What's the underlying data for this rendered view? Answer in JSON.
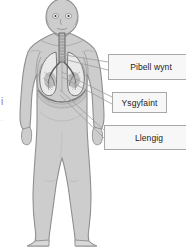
{
  "diagram": {
    "language": "Welsh",
    "background_color": "#ffffff"
  },
  "figure": {
    "name": "human-body-outline",
    "body_fill": "#cdcdcd",
    "body_outline": "#8f8f8f",
    "organ_fill": "#e8e8e8",
    "organ_outline": "#707070",
    "parts": [
      {
        "name": "head",
        "label_key": null
      },
      {
        "name": "neck",
        "label_key": null
      },
      {
        "name": "torso",
        "label_key": null
      },
      {
        "name": "trachea",
        "label_key": "trachea"
      },
      {
        "name": "bronchi",
        "label_key": "trachea"
      },
      {
        "name": "left-lung",
        "label_key": "lungs"
      },
      {
        "name": "right-lung",
        "label_key": "lungs"
      },
      {
        "name": "ribcage",
        "label_key": null
      },
      {
        "name": "diaphragm",
        "label_key": "diaphragm"
      },
      {
        "name": "arms",
        "label_key": null
      },
      {
        "name": "legs",
        "label_key": null
      },
      {
        "name": "feet",
        "label_key": null
      }
    ]
  },
  "callouts": [
    {
      "id": "trachea",
      "label": "Pibell wynt",
      "english": "Windpipe / trachea",
      "box": {
        "x": 108,
        "y": 54,
        "w": 86,
        "h": 26
      },
      "leader_target": {
        "x": 58,
        "y": 58
      }
    },
    {
      "id": "lungs",
      "label": "Ysgyfaint",
      "english": "Lungs",
      "box": {
        "x": 112,
        "y": 92,
        "w": 55,
        "h": 21
      },
      "leader_target": {
        "x": 63,
        "y": 75
      }
    },
    {
      "id": "diaphragm",
      "label": "Llengig",
      "english": "Diaphragm",
      "box": {
        "x": 104,
        "y": 125,
        "w": 90,
        "h": 25
      },
      "leader_target": {
        "x": 62,
        "y": 92
      }
    }
  ],
  "page_edge": {
    "fragment": "i",
    "fragment_secondary": "."
  },
  "colors": {
    "box_fill": "#f7f7f7",
    "box_border": "#a8a8a8",
    "text": "#1d1d1d",
    "leader_line": "#9d9d9d"
  }
}
